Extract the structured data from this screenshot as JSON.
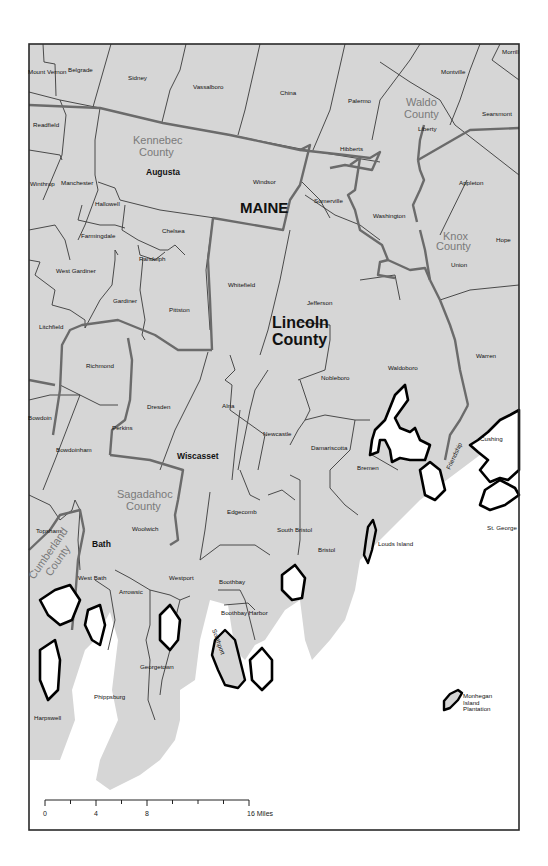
{
  "map": {
    "state_label": "MAINE",
    "focus_county": {
      "name_line1": "Lincoln",
      "name_line2": "County"
    },
    "counties": [
      {
        "key": "kennebec",
        "line1": "Kennebec",
        "line2": "County"
      },
      {
        "key": "waldo",
        "line1": "Waldo",
        "line2": "County"
      },
      {
        "key": "knox",
        "line1": "Knox",
        "line2": "County"
      },
      {
        "key": "sagadahoc",
        "line1": "Sagadahoc",
        "line2": "County"
      },
      {
        "key": "cumberland",
        "line1": "Cumberland",
        "line2": "County"
      }
    ],
    "county_seats": [
      "Augusta",
      "Wiscasset",
      "Bath"
    ],
    "towns": [
      "Mount Vernon",
      "Belgrade",
      "Sidney",
      "Vassalboro",
      "China",
      "Palermo",
      "Montville",
      "Morrill",
      "Readfield",
      "Liberty",
      "Searsmont",
      "Hibberts",
      "Winthrop",
      "Manchester",
      "Windsor",
      "Appleton",
      "Hallowell",
      "Somerville",
      "Washington",
      "Farmingdale",
      "Chelsea",
      "Hope",
      "Randolph",
      "Union",
      "West Gardiner",
      "Whitefield",
      "Gardiner",
      "Pittston",
      "Jefferson",
      "Litchfield",
      "Richmond",
      "Warren",
      "Nobleboro",
      "Waldoboro",
      "Bowdoin",
      "Dresden",
      "Alna",
      "Perkins",
      "Bowdoinham",
      "Newcastle",
      "Damariscotta",
      "Friendship",
      "Cushing",
      "Bremen",
      "Edgecomb",
      "Topsham",
      "Woolwich",
      "South Bristol",
      "Louds Island",
      "St. George",
      "Bristol",
      "West Bath",
      "Westport",
      "Arrowsic",
      "Boothbay",
      "Boothbay Harbor",
      "Southport",
      "Georgetown",
      "Harpswell",
      "Phippsburg",
      "Monhegan Island Plantation"
    ],
    "scale_bar": {
      "ticks": [
        "0",
        "4",
        "8",
        "16 Miles"
      ],
      "max_miles": 16
    },
    "colors": {
      "land": "#d6d6d6",
      "water": "#ffffff",
      "county_label": "#7a7a7a",
      "county_boundary": "#6b6b6b",
      "coastline": "#000000"
    }
  }
}
